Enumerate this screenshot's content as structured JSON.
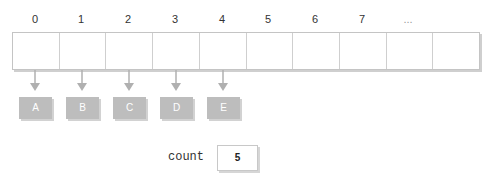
{
  "array": {
    "indices": [
      "0",
      "1",
      "2",
      "3",
      "4",
      "5",
      "6",
      "7",
      "..."
    ],
    "cell_count": 10
  },
  "nodes": [
    "A",
    "B",
    "C",
    "D",
    "E"
  ],
  "count": {
    "label": "count",
    "value": "5"
  },
  "colors": {
    "node_fill": "#bdbdbd",
    "border": "#c4c4c4",
    "arrow": "#b0b0b0"
  }
}
